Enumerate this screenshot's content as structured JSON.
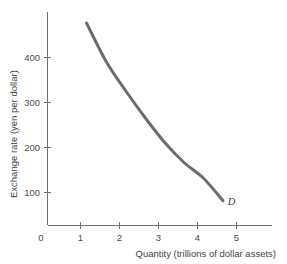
{
  "chart_data": {
    "type": "line",
    "title": "",
    "subtitle": "",
    "xlabel": "Quantity (trillions of dollar assets)",
    "ylabel": "Exchange rate (yen per dollar)",
    "xlim": [
      0,
      5.8
    ],
    "ylim": [
      0,
      500
    ],
    "grid": false,
    "legend_position": "inline-curve-label",
    "x_ticks": [
      "0",
      "1",
      "2",
      "3",
      "4",
      "5"
    ],
    "x_tick_values": [
      0,
      1,
      2,
      3,
      4,
      5
    ],
    "y_ticks": [
      "100",
      "200",
      "300",
      "400"
    ],
    "y_tick_values": [
      100,
      200,
      300,
      400
    ],
    "series": [
      {
        "name": "D",
        "label": "D",
        "color": "#6d6d6d",
        "x": [
          1.0,
          1.5,
          2.0,
          2.5,
          3.0,
          3.5,
          4.0,
          4.5
        ],
        "y": [
          450,
          365,
          300,
          240,
          185,
          140,
          105,
          55
        ],
        "points": [
          {
            "x": 1.0,
            "y": 450
          },
          {
            "x": 1.5,
            "y": 365
          },
          {
            "x": 2.0,
            "y": 300
          },
          {
            "x": 2.5,
            "y": 240
          },
          {
            "x": 3.0,
            "y": 185
          },
          {
            "x": 3.5,
            "y": 140
          },
          {
            "x": 4.0,
            "y": 105
          },
          {
            "x": 4.5,
            "y": 55
          }
        ]
      }
    ],
    "annotations": [
      {
        "text": "D",
        "x": 4.62,
        "y": 45,
        "style": "italic"
      }
    ]
  },
  "axes": {
    "y_axis_title": "Exchange rate (yen per dollar)",
    "x_axis_title": "Quantity (trillions of dollar assets)",
    "origin_label": "0",
    "y_tick_labels": [
      "400",
      "300",
      "200",
      "100"
    ],
    "x_tick_labels": [
      "1",
      "2",
      "3",
      "4",
      "5"
    ]
  },
  "curve": {
    "label": "D",
    "color": "#6d6d6d",
    "stroke_width": "3"
  },
  "colors": {
    "background": "#ffffff",
    "axis": "#6f6f6f",
    "text": "#3f3f3f",
    "curve": "#6d6d6d"
  }
}
